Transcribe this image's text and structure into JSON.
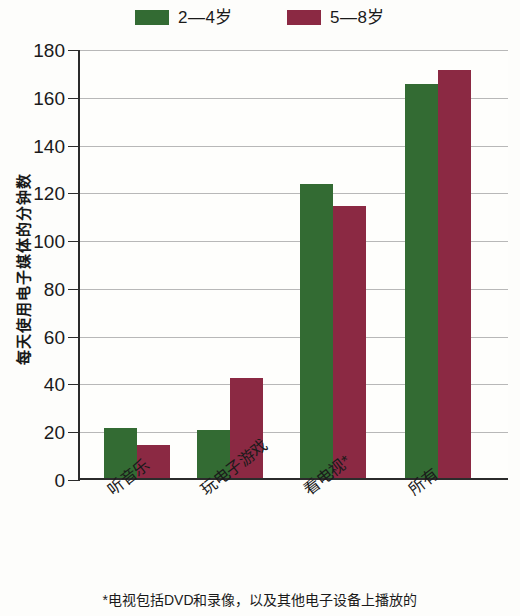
{
  "chart_data": {
    "type": "bar",
    "title": "",
    "subtitle": "",
    "xlabel": "",
    "ylabel": "每天使用电子媒体的分钟数",
    "ylim": [
      0,
      180
    ],
    "yticks": [
      0,
      20,
      40,
      60,
      80,
      100,
      120,
      140,
      160,
      180
    ],
    "ytick_labels": [
      "0",
      "20",
      "40",
      "60",
      "80",
      "100",
      "120",
      "140",
      "160",
      "180"
    ],
    "grid": true,
    "legend_position": "top-center",
    "categories": [
      "听音乐",
      "玩电子游戏",
      "看电视*",
      "所有"
    ],
    "series": [
      {
        "name": "2—4岁",
        "color": "#336b33",
        "values": [
          21,
          20,
          123,
          165
        ]
      },
      {
        "name": "5—8岁",
        "color": "#8b2943",
        "values": [
          14,
          42,
          114,
          171
        ]
      }
    ],
    "annotations": [
      "*电视包括DVD和录像，以及其他电子设备上播放的"
    ]
  },
  "legend": {
    "entries": [
      {
        "label": "2—4岁",
        "swatch_name": "legend-swatch-green"
      },
      {
        "label": "5—8岁",
        "swatch_name": "legend-swatch-maroon"
      }
    ]
  },
  "axes": {
    "y_title": "每天使用电子媒体的分钟数",
    "y_labels": [
      "180",
      "160",
      "140",
      "120",
      "100",
      "80",
      "60",
      "40",
      "20",
      "0"
    ],
    "x_labels": [
      "听音乐",
      "玩电子游戏",
      "看电视*",
      "所有"
    ]
  },
  "footnote": {
    "text": "*电视包括DVD和录像，以及其他电子设备上播放的"
  },
  "colors": {
    "series_1": "#336b33",
    "series_2": "#8b2943",
    "axis": "#2b2b2b",
    "grid": "#b8b8b8",
    "background": "#fdfdfb"
  }
}
